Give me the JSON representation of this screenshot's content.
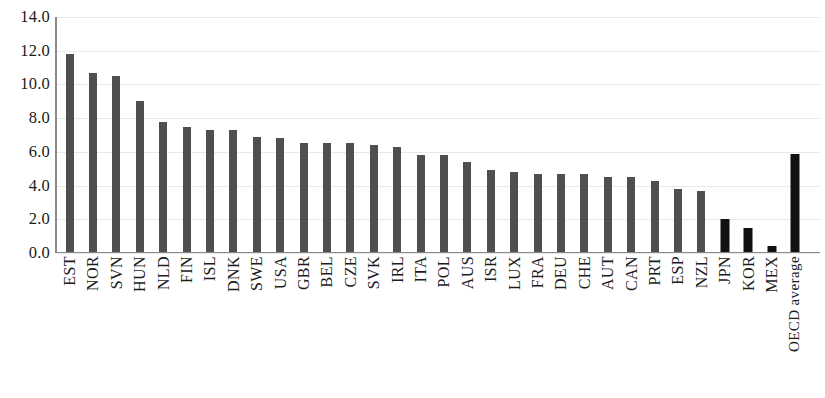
{
  "chart_data": {
    "type": "bar",
    "title": "",
    "xlabel": "",
    "ylabel": "",
    "ylim": [
      0,
      14
    ],
    "ytick_step": 2,
    "grid": true,
    "legend": "none",
    "ytick_labels": [
      "14.0",
      "12.0",
      "10.0",
      "8.0",
      "6.0",
      "4.0",
      "2.0",
      "0.0"
    ],
    "categories": [
      "EST",
      "NOR",
      "SVN",
      "HUN",
      "NLD",
      "FIN",
      "ISL",
      "DNK",
      "SWE",
      "USA",
      "GBR",
      "BEL",
      "CZE",
      "SVK",
      "IRL",
      "ITA",
      "POL",
      "AUS",
      "ISR",
      "LUX",
      "FRA",
      "DEU",
      "CHE",
      "AUT",
      "CAN",
      "PRT",
      "ESP",
      "NZL",
      "JPN",
      "KOR",
      "MEX",
      "OECD average"
    ],
    "values": [
      11.8,
      10.7,
      10.5,
      9.0,
      7.8,
      7.5,
      7.3,
      7.3,
      6.9,
      6.8,
      6.5,
      6.5,
      6.5,
      6.4,
      6.3,
      5.8,
      5.8,
      5.4,
      4.9,
      4.8,
      4.7,
      4.7,
      4.7,
      4.5,
      4.5,
      4.3,
      3.8,
      3.7,
      2.0,
      1.5,
      0.4,
      5.9
    ],
    "highlighted": [
      "JPN",
      "KOR",
      "MEX",
      "OECD average"
    ],
    "bar_color": "#4f4f4f",
    "highlight_color": "#111111"
  }
}
